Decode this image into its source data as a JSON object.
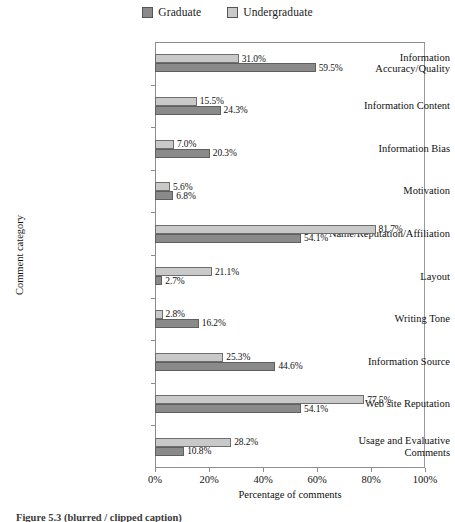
{
  "legend": {
    "position": "top-center",
    "entries": [
      {
        "label": "Graduate",
        "color": "#8a8a8a",
        "key": "graduate"
      },
      {
        "label": "Undergraduate",
        "color": "#c9c9c9",
        "key": "undergraduate"
      }
    ]
  },
  "axes": {
    "x_title": "Percentage of comments",
    "y_title": "Comment category",
    "x_ticks": [
      "0%",
      "20%",
      "40%",
      "60%",
      "80%",
      "100%"
    ]
  },
  "caption": "Figure 5.3  (blurred / clipped caption)",
  "chart_data": {
    "type": "bar",
    "orientation": "horizontal",
    "title": "",
    "xlabel": "Percentage of comments",
    "ylabel": "Comment category",
    "xlim": [
      0,
      100
    ],
    "xticks": [
      0,
      20,
      40,
      60,
      80,
      100
    ],
    "grid": false,
    "legend_position": "top-center",
    "value_label_suffix": "%",
    "categories": [
      "Information\nAccuracy/Quality",
      "Information Content",
      "Information Bias",
      "Motivation",
      "Name/Reputation/Affiliation",
      "Layout",
      "Writing Tone",
      "Information Source",
      "Web site Reputation",
      "Usage and Evaluative\nComments"
    ],
    "series": [
      {
        "name": "Undergraduate",
        "color": "#c9c9c9",
        "values": [
          31.0,
          15.5,
          7.0,
          5.6,
          81.7,
          21.1,
          2.8,
          25.3,
          77.5,
          28.2
        ],
        "labels": [
          "31.0%",
          "15.5%",
          "7.0%",
          "5.6%",
          "81.7%",
          "21.1%",
          "2.8%",
          "25.3%",
          "77.5%",
          "28.2%"
        ]
      },
      {
        "name": "Graduate",
        "color": "#8a8a8a",
        "values": [
          59.5,
          24.3,
          20.3,
          6.8,
          54.1,
          2.7,
          16.2,
          44.6,
          54.1,
          10.8
        ],
        "labels": [
          "59.5%",
          "24.3%",
          "20.3%",
          "6.8%",
          "54.1%",
          "2.7%",
          "16.2%",
          "44.6%",
          "54.1%",
          "10.8%"
        ]
      }
    ]
  }
}
